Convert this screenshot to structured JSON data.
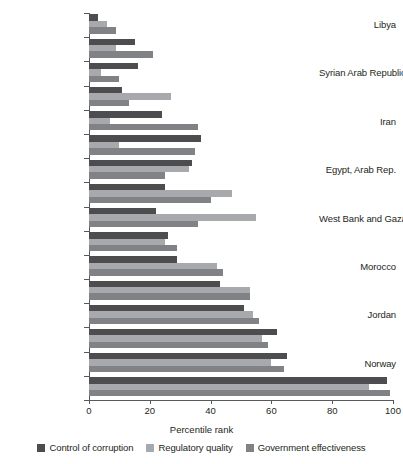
{
  "chart_data": {
    "type": "bar",
    "orientation": "horizontal",
    "title": "",
    "xlabel": "Percentile rank",
    "ylabel": "",
    "xlim": [
      0,
      100
    ],
    "xticks": [
      0,
      20,
      40,
      60,
      80,
      100
    ],
    "grid": false,
    "legend_position": "bottom",
    "categories": [
      "Libya",
      "",
      "Syrian Arab Republic",
      "",
      "Iran",
      "",
      "Egypt, Arab Rep.",
      "",
      "West Bank and Gaza",
      "",
      "Morocco",
      "",
      "Jordan",
      "",
      "Norway",
      ""
    ],
    "visible_category_labels": [
      "Libya",
      "Syrian Arab Republic",
      "Iran",
      "Egypt, Arab Rep.",
      "West Bank and Gaza",
      "Morocco",
      "Jordan",
      "Norway"
    ],
    "series": [
      {
        "name": "Control of corruption",
        "color": "#4d4d4f",
        "values": [
          3,
          15,
          16,
          11,
          24,
          37,
          34,
          25,
          22,
          26,
          29,
          43,
          51,
          62,
          65,
          98
        ]
      },
      {
        "name": "Regulatory quality",
        "color": "#a7a9ac",
        "values": [
          6,
          9,
          4,
          27,
          7,
          10,
          33,
          47,
          55,
          25,
          42,
          53,
          54,
          57,
          60,
          92
        ]
      },
      {
        "name": "Government effectiveness",
        "color": "#808285",
        "values": [
          9,
          21,
          10,
          13,
          36,
          35,
          25,
          40,
          36,
          29,
          44,
          53,
          56,
          59,
          64,
          99
        ]
      }
    ]
  },
  "legend": {
    "items": [
      {
        "label": "Control of corruption",
        "color": "#4d4d4f"
      },
      {
        "label": "Regulatory quality",
        "color": "#a7a9ac"
      },
      {
        "label": "Government effectiveness",
        "color": "#808285"
      }
    ]
  }
}
